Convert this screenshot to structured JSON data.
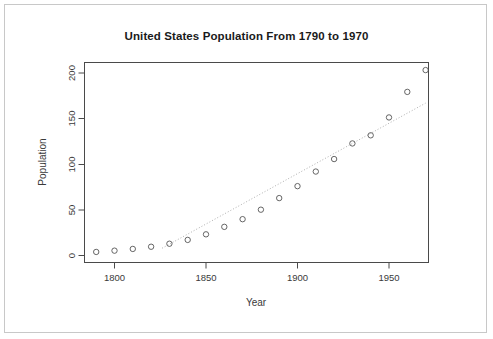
{
  "chart_data": {
    "type": "scatter",
    "title": "United States Population From 1790 to 1970",
    "xlabel": "Year",
    "ylabel": "Population",
    "xlim": [
      1785,
      1975
    ],
    "ylim": [
      -5,
      210
    ],
    "xticks": [
      1800,
      1850,
      1900,
      1950
    ],
    "yticks": [
      0,
      50,
      100,
      150,
      200
    ],
    "grid": false,
    "legend": null,
    "x": [
      1790,
      1800,
      1810,
      1820,
      1830,
      1840,
      1850,
      1860,
      1870,
      1880,
      1890,
      1900,
      1910,
      1920,
      1930,
      1940,
      1950,
      1960,
      1970
    ],
    "y": [
      3.9,
      5.3,
      7.2,
      9.6,
      12.9,
      17.1,
      23.2,
      31.4,
      39.8,
      50.2,
      62.9,
      76.0,
      92.0,
      105.7,
      122.8,
      131.7,
      151.3,
      179.3,
      203.2
    ],
    "series": [
      {
        "name": "US Population",
        "marker": "open-circle",
        "values": [
          3.9,
          5.3,
          7.2,
          9.6,
          12.9,
          17.1,
          23.2,
          31.4,
          39.8,
          50.2,
          62.9,
          76.0,
          92.0,
          105.7,
          122.8,
          131.7,
          151.3,
          179.3,
          203.2
        ]
      }
    ],
    "trend_line": {
      "style": "dotted",
      "x": [
        1826,
        1970
      ],
      "y": [
        8.0,
        167.0
      ]
    },
    "colors": {
      "point_stroke": "#555555",
      "trend_line": "#b0b0b0",
      "axis": "#4a4a4a",
      "text": "#3a3a3a",
      "background": "#ffffff",
      "canvas_border": "#c8c8c8"
    }
  }
}
